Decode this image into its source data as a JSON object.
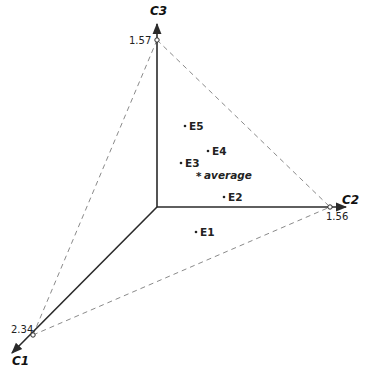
{
  "axes": {
    "c1": {
      "label": "C1",
      "tick_value": "2.34"
    },
    "c2": {
      "label": "C2",
      "tick_value": "1.56"
    },
    "c3": {
      "label": "C3",
      "tick_value": "1.57"
    }
  },
  "points": [
    {
      "label": "E1"
    },
    {
      "label": "E2"
    },
    {
      "label": "E3"
    },
    {
      "label": "E4"
    },
    {
      "label": "E5"
    }
  ],
  "average": {
    "marker": "*",
    "label": "average"
  },
  "colors": {
    "axis": "#2a2a2a",
    "dashed": "#8a8a8a",
    "text": "#222222"
  }
}
